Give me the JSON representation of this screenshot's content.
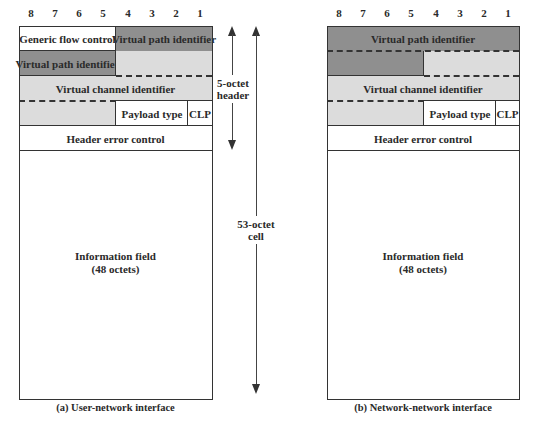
{
  "bit_numbers": [
    "8",
    "7",
    "6",
    "5",
    "4",
    "3",
    "2",
    "1"
  ],
  "uni": {
    "caption": "(a) User-network interface",
    "fields": {
      "gfc": "Generic flow control",
      "vpi_1": "Virtual path identifier",
      "vpi_2": "Virtual path identifier",
      "vci": "Virtual channel identifier",
      "payload_type": "Payload type",
      "clp": "CLP",
      "hec": "Header error control",
      "info_line1": "Information field",
      "info_line2": "(48 octets)"
    }
  },
  "nni": {
    "caption": "(b) Network-network interface",
    "fields": {
      "vpi": "Virtual path identifier",
      "vci": "Virtual channel identifier",
      "payload_type": "Payload type",
      "clp": "CLP",
      "hec": "Header error control",
      "info_line1": "Information field",
      "info_line2": "(48 octets)"
    }
  },
  "annotations": {
    "header_line1": "5-octet",
    "header_line2": "header",
    "cell_line1": "53-octet",
    "cell_line2": "cell"
  },
  "colors": {
    "vpi_shade": "#8f8f8f",
    "vci_shade": "#dcdcdc",
    "outline": "#333333"
  }
}
